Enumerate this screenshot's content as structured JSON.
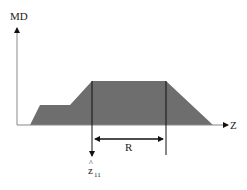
{
  "diagram": {
    "y_axis_label": "MD",
    "x_axis_label": "Z",
    "dimension_label": "R",
    "marker_label_base": "z",
    "marker_label_hat": "^",
    "marker_label_sub": "11",
    "colors": {
      "fill": "#6e6e6e",
      "axis": "#888888",
      "line": "#111111"
    }
  }
}
